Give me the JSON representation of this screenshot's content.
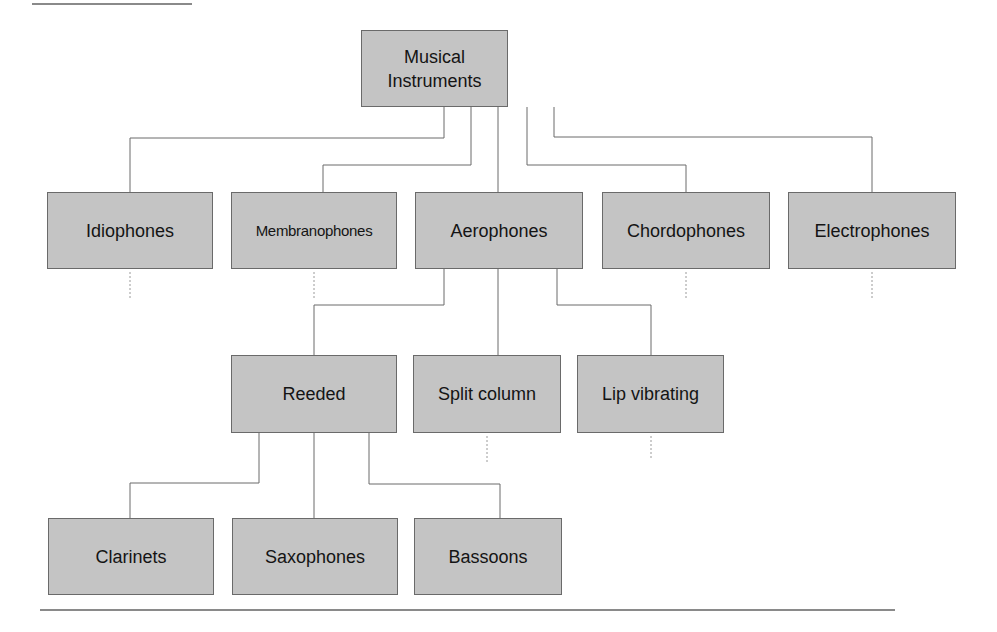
{
  "diagram": {
    "root": {
      "label_line1": "Musical",
      "label_line2": "Instruments"
    },
    "families": [
      {
        "label": "Idiophones"
      },
      {
        "label": "Membranophones"
      },
      {
        "label": "Aerophones"
      },
      {
        "label": "Chordophones"
      },
      {
        "label": "Electrophones"
      }
    ],
    "aerophone_types": [
      {
        "label": "Reeded"
      },
      {
        "label": "Split column"
      },
      {
        "label": "Lip vibrating"
      }
    ],
    "reeded_instruments": [
      {
        "label": "Clarinets"
      },
      {
        "label": "Saxophones"
      },
      {
        "label": "Bassoons"
      }
    ],
    "colors": {
      "box_fill": "#c4c4c4",
      "box_border": "#6a6a6a",
      "connector": "#6a6a6a"
    }
  }
}
